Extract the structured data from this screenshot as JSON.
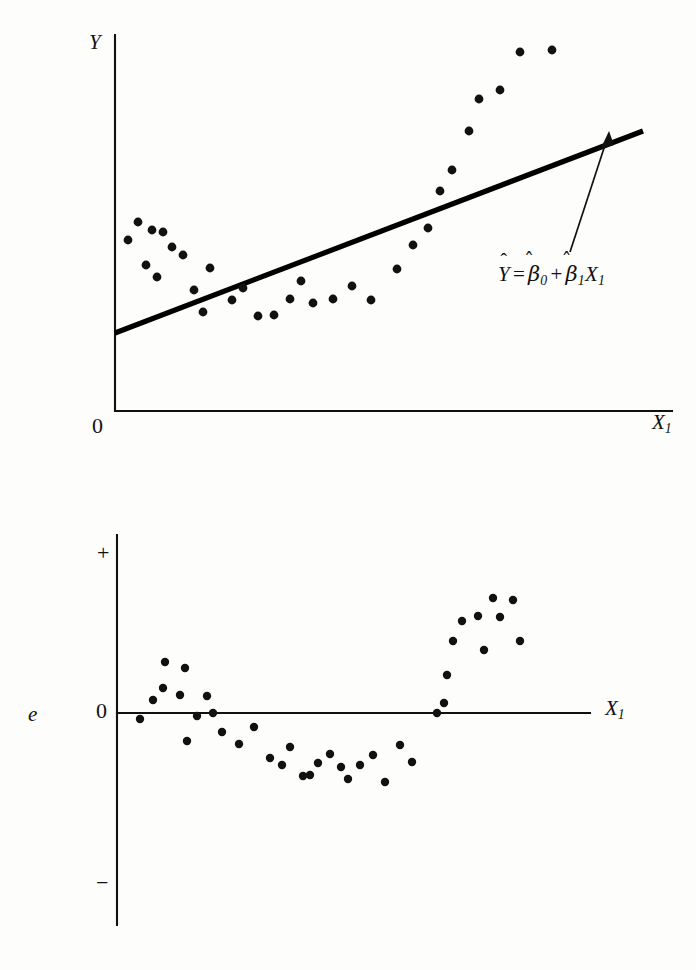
{
  "figure": {
    "background_color": "#fdfdfc",
    "ink_color": "#111111",
    "point_color": "#111111"
  },
  "chart_data": [
    {
      "id": "scatter-with-fitted-line",
      "type": "scatter",
      "title": "",
      "xlabel": "X1",
      "ylabel": "Y",
      "origin_label": "0",
      "grid": false,
      "legend": "none",
      "annotations": [
        {
          "name": "fitted-line-equation",
          "text": "Ŷ = β̂0 + β̂1X1",
          "parts": {
            "lhs": "Y",
            "equals": "=",
            "beta0": "β",
            "beta0_sub": "0",
            "plus": "+",
            "beta1": "β",
            "beta1_sub": "1",
            "x": "X",
            "x_sub": "1"
          },
          "x": 498,
          "y": 277
        }
      ],
      "axis": {
        "x_axis_y": 411,
        "y_axis_x": 115,
        "x_axis_x0": 115,
        "x_axis_x1": 672,
        "y_axis_y0": 35,
        "y_axis_y1": 411
      },
      "fitted_line": {
        "name": "least-squares-line",
        "x0": 115,
        "y0": 333,
        "x1": 643,
        "y1": 131
      },
      "arrow": {
        "name": "equation-pointer-arrow",
        "x0": 570,
        "y0": 252,
        "x1": 609,
        "y1": 133
      },
      "points": [
        [
          152,
          230
        ],
        [
          138,
          222
        ],
        [
          128,
          240
        ],
        [
          163,
          232
        ],
        [
          172,
          247
        ],
        [
          146,
          265
        ],
        [
          183,
          255
        ],
        [
          210,
          268
        ],
        [
          157,
          277
        ],
        [
          194,
          290
        ],
        [
          232,
          300
        ],
        [
          243,
          288
        ],
        [
          203,
          312
        ],
        [
          258,
          316
        ],
        [
          274,
          315
        ],
        [
          290,
          299
        ],
        [
          301,
          281
        ],
        [
          313,
          303
        ],
        [
          333,
          299
        ],
        [
          352,
          286
        ],
        [
          371,
          300
        ],
        [
          397,
          269
        ],
        [
          413,
          245
        ],
        [
          428,
          228
        ],
        [
          440,
          191
        ],
        [
          452,
          170
        ],
        [
          469,
          131
        ],
        [
          479,
          99
        ],
        [
          500,
          90
        ],
        [
          520,
          52
        ],
        [
          552,
          50
        ]
      ],
      "n_points": 31
    },
    {
      "id": "residual-plot",
      "type": "scatter",
      "title": "",
      "xlabel": "X1",
      "ylabel": "e",
      "grid": false,
      "legend": "none",
      "y_tick_labels": {
        "positive": "+",
        "zero": "0",
        "negative": "−"
      },
      "axis": {
        "x_axis_y": 713,
        "y_axis_x": 117,
        "x_axis_x0": 117,
        "x_axis_x1": 590,
        "y_axis_y0": 535,
        "y_axis_y1": 925,
        "plus_tick_y": 553,
        "minus_tick_y": 883
      },
      "points": [
        [
          140,
          719
        ],
        [
          153,
          700
        ],
        [
          163,
          688
        ],
        [
          165,
          662
        ],
        [
          180,
          695
        ],
        [
          185,
          668
        ],
        [
          187,
          741
        ],
        [
          197,
          716
        ],
        [
          207,
          696
        ],
        [
          213,
          713
        ],
        [
          222,
          732
        ],
        [
          239,
          744
        ],
        [
          254,
          727
        ],
        [
          270,
          758
        ],
        [
          282,
          765
        ],
        [
          290,
          747
        ],
        [
          303,
          776
        ],
        [
          310,
          775
        ],
        [
          318,
          763
        ],
        [
          330,
          754
        ],
        [
          341,
          767
        ],
        [
          348,
          779
        ],
        [
          360,
          765
        ],
        [
          373,
          755
        ],
        [
          385,
          782
        ],
        [
          400,
          745
        ],
        [
          412,
          762
        ],
        [
          437,
          713
        ],
        [
          444,
          703
        ],
        [
          447,
          675
        ],
        [
          453,
          641
        ],
        [
          462,
          621
        ],
        [
          478,
          616
        ],
        [
          484,
          650
        ],
        [
          493,
          598
        ],
        [
          500,
          617
        ],
        [
          513,
          600
        ],
        [
          520,
          641
        ]
      ],
      "n_points": 38
    }
  ],
  "labels": {
    "top_y_axis": "Y",
    "top_origin": "0",
    "top_x_axis_var": "X",
    "top_x_axis_sub": "1",
    "bottom_e": "e",
    "bottom_plus": "+",
    "bottom_zero": "0",
    "bottom_minus": "−",
    "bottom_x_axis_var": "X",
    "bottom_x_axis_sub": "1"
  }
}
